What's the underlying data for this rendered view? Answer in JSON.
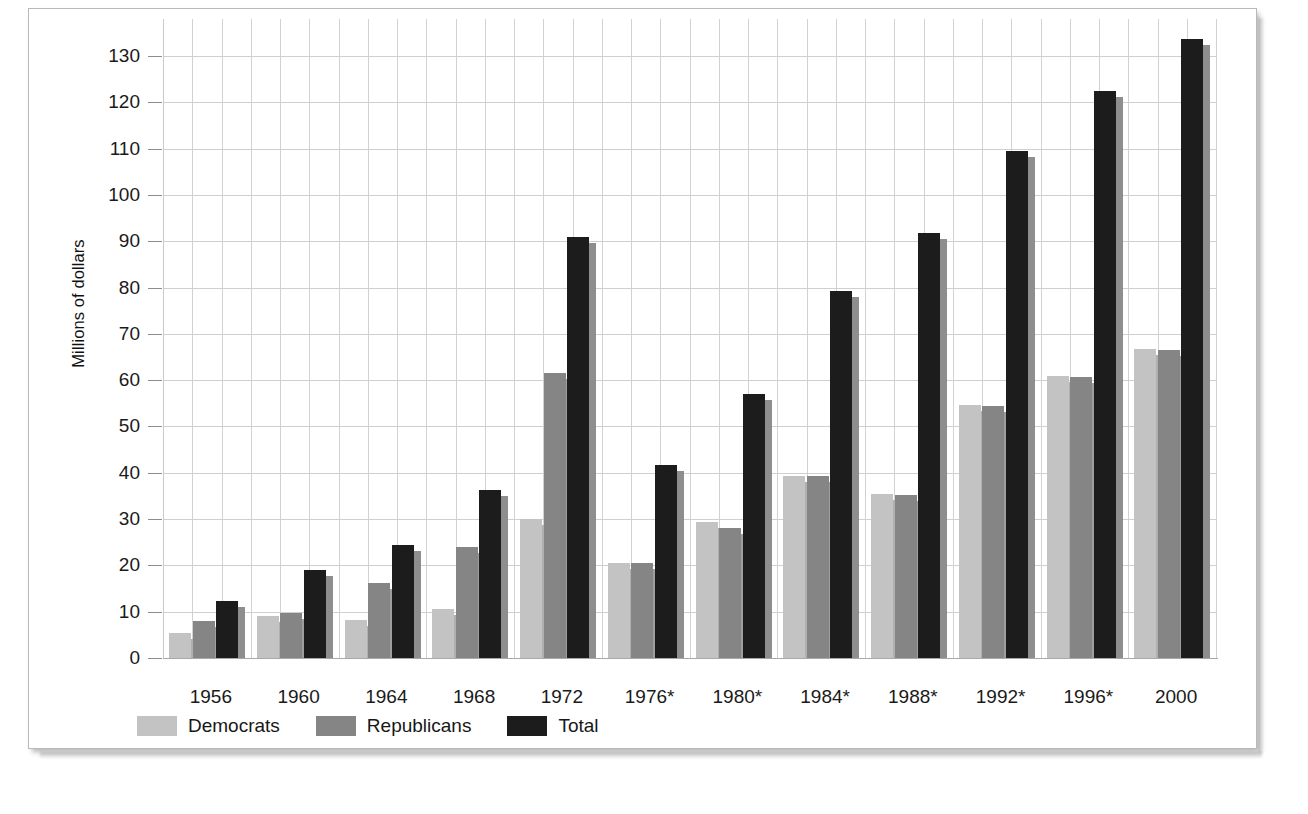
{
  "chart_data": {
    "type": "bar",
    "title": "",
    "subtitle": "",
    "xlabel": "",
    "ylabel": "Millions of dollars",
    "ylim": [
      0,
      135
    ],
    "ytick_step": 10,
    "grid": true,
    "legend_position": "bottom-left",
    "yticks": [
      "130",
      "120",
      "110",
      "100",
      "90",
      "80",
      "70",
      "60",
      "50",
      "40",
      "30",
      "20",
      "10",
      "0"
    ],
    "ytick_values": [
      130,
      120,
      110,
      100,
      90,
      80,
      70,
      60,
      50,
      40,
      30,
      20,
      10,
      0
    ],
    "categories": [
      "1956",
      "1960",
      "1964",
      "1968",
      "1972",
      "1976*",
      "1980*",
      "1984*",
      "1988*",
      "1992*",
      "1996*",
      "2000"
    ],
    "series": [
      {
        "name": "Democrats",
        "color": "#c3c3c3",
        "values": [
          5.3,
          9.0,
          8.2,
          10.5,
          30.0,
          20.6,
          29.4,
          39.3,
          35.5,
          54.7,
          60.8,
          66.8
        ]
      },
      {
        "name": "Republicans",
        "color": "#858585",
        "values": [
          8.1,
          9.8,
          16.2,
          23.9,
          61.5,
          20.6,
          28.0,
          39.2,
          35.2,
          54.5,
          60.7,
          66.5
        ]
      },
      {
        "name": "Total",
        "color": "#1c1c1c",
        "values": [
          12.4,
          19.0,
          24.3,
          36.2,
          91.0,
          41.6,
          57.1,
          79.2,
          91.8,
          109.5,
          122.4,
          133.6
        ]
      }
    ]
  },
  "legend": {
    "items": [
      {
        "label": "Democrats",
        "color": "#c3c3c3"
      },
      {
        "label": "Republicans",
        "color": "#858585"
      },
      {
        "label": "Total",
        "color": "#1c1c1c"
      }
    ]
  },
  "axes": {
    "y_title": "Millions of dollars"
  }
}
